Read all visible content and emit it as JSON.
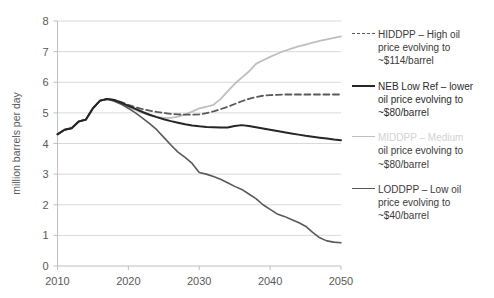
{
  "chart_data": {
    "type": "line",
    "title": "",
    "xlabel": "",
    "ylabel": "million barrels per day",
    "xlim": [
      2010,
      2050
    ],
    "ylim": [
      0,
      8
    ],
    "xticks": [
      "2010",
      "2020",
      "2030",
      "2040",
      "2050"
    ],
    "yticks": [
      "0",
      "1",
      "2",
      "3",
      "4",
      "5",
      "6",
      "7",
      "8"
    ],
    "grid": "horizontal",
    "legend_position": "right",
    "x": [
      2010,
      2011,
      2012,
      2013,
      2014,
      2015,
      2016,
      2017,
      2018,
      2019,
      2020,
      2021,
      2022,
      2023,
      2024,
      2025,
      2026,
      2027,
      2028,
      2029,
      2030,
      2031,
      2032,
      2033,
      2034,
      2035,
      2036,
      2037,
      2038,
      2039,
      2040,
      2041,
      2042,
      2043,
      2044,
      2045,
      2046,
      2047,
      2048,
      2049,
      2050
    ],
    "series": [
      {
        "name": "HIDDPP",
        "label": "HIDDPP – High oil price evolving to ~$114/barrel",
        "color": "#595959",
        "style": "dashed",
        "width": 1.8,
        "values": [
          4.3,
          4.45,
          4.5,
          4.72,
          4.78,
          5.15,
          5.4,
          5.45,
          5.42,
          5.35,
          5.26,
          5.18,
          5.12,
          5.07,
          5.03,
          5.0,
          4.97,
          4.95,
          4.94,
          4.94,
          4.95,
          4.99,
          5.05,
          5.12,
          5.2,
          5.29,
          5.38,
          5.46,
          5.52,
          5.56,
          5.58,
          5.59,
          5.6,
          5.6,
          5.6,
          5.6,
          5.6,
          5.6,
          5.6,
          5.6,
          5.6
        ]
      },
      {
        "name": "NEB Low Ref",
        "label": "NEB Low Ref – lower oil price evolving to ~$80/barrel",
        "color": "#262626",
        "style": "solid",
        "width": 2.0,
        "values": [
          4.3,
          4.45,
          4.5,
          4.72,
          4.78,
          5.15,
          5.4,
          5.45,
          5.42,
          5.33,
          5.23,
          5.13,
          5.03,
          4.94,
          4.86,
          4.79,
          4.73,
          4.68,
          4.63,
          4.59,
          4.56,
          4.54,
          4.53,
          4.52,
          4.52,
          4.57,
          4.6,
          4.57,
          4.53,
          4.49,
          4.45,
          4.41,
          4.37,
          4.33,
          4.29,
          4.25,
          4.22,
          4.19,
          4.16,
          4.13,
          4.11
        ]
      },
      {
        "name": "MIDDPP",
        "label": "MIDDPP – Medium oil price evolving to ~$80/barrel",
        "color": "#bfbfbf",
        "style": "solid",
        "width": 1.8,
        "values": [
          4.3,
          4.45,
          4.5,
          4.72,
          4.78,
          5.15,
          5.4,
          5.45,
          5.4,
          5.3,
          5.2,
          5.1,
          5.0,
          4.92,
          4.87,
          4.84,
          4.84,
          4.88,
          4.95,
          5.04,
          5.15,
          5.2,
          5.26,
          5.45,
          5.7,
          5.95,
          6.15,
          6.35,
          6.6,
          6.72,
          6.83,
          6.93,
          7.02,
          7.1,
          7.17,
          7.23,
          7.29,
          7.35,
          7.4,
          7.45,
          7.5
        ]
      },
      {
        "name": "LODDPP",
        "label": "LODDPP – Low oil price evolving to ~$40/barrel",
        "color": "#595959",
        "style": "solid",
        "width": 1.6,
        "values": [
          4.3,
          4.45,
          4.5,
          4.72,
          4.78,
          5.15,
          5.4,
          5.45,
          5.38,
          5.28,
          5.15,
          5.0,
          4.83,
          4.65,
          4.45,
          4.2,
          3.95,
          3.72,
          3.55,
          3.35,
          3.05,
          3.0,
          2.92,
          2.83,
          2.72,
          2.6,
          2.5,
          2.35,
          2.2,
          2.0,
          1.85,
          1.7,
          1.62,
          1.52,
          1.42,
          1.3,
          1.1,
          0.92,
          0.82,
          0.78,
          0.76
        ]
      }
    ]
  },
  "legend": {
    "entries": [
      {
        "key": "high",
        "line1": "HIDDPP – High oil",
        "line2": "price evolving to",
        "line3": "~$114/barrel"
      },
      {
        "key": "ref",
        "line1": "NEB Low Ref – lower",
        "line2": "oil price evolving to",
        "line3": "~$80/barrel"
      },
      {
        "key": "mid",
        "line1": "MIDDPP – Medium",
        "line2": "oil price evolving to",
        "line3": "~$80/barrel"
      },
      {
        "key": "low",
        "line1": "LODDPP – Low oil",
        "line2": "price evolving to",
        "line3": "~$40/barrel"
      }
    ]
  },
  "axes": {
    "y_title": "million barrels per day"
  }
}
